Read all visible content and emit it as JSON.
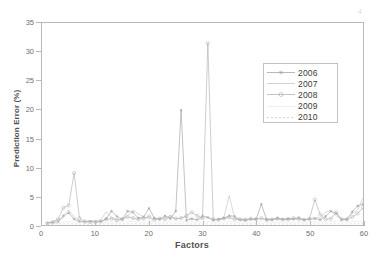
{
  "figure": {
    "background": "#ffffff",
    "frame_color": "#b9b9b9",
    "artifact_mark": "4"
  },
  "axes": {
    "x": {
      "label": "Factors",
      "min": 0,
      "max": 60,
      "ticks": [
        0,
        10,
        20,
        30,
        40,
        50,
        60
      ],
      "tick_labels": [
        "0",
        "10",
        "20",
        "30",
        "40",
        "50",
        "60"
      ]
    },
    "y": {
      "label": "Prediction Error (%)",
      "min": 0,
      "max": 35,
      "ticks": [
        0,
        5,
        10,
        15,
        20,
        25,
        30,
        35
      ],
      "tick_labels": [
        "0",
        "5",
        "10",
        "15",
        "20",
        "25",
        "30",
        "35"
      ]
    }
  },
  "legend": {
    "position": "upper-right-inset",
    "border_color": "#c2c2c2",
    "entries": [
      {
        "label": "2006",
        "style": "line-marker-star",
        "color": "#9a9a9a",
        "marker": "star",
        "dash": "none"
      },
      {
        "label": "2007",
        "style": "line-plain",
        "color": "#bfbfbf",
        "marker": "none",
        "dash": "none"
      },
      {
        "label": "2008",
        "style": "line-marker-circle",
        "color": "#ababab",
        "marker": "circle",
        "dash": "none"
      },
      {
        "label": "2009",
        "style": "line-faint",
        "color": "#e8e8e8",
        "marker": "none",
        "dash": "none"
      },
      {
        "label": "2010",
        "style": "line-dotted",
        "color": "#c9c9c9",
        "marker": "none",
        "dash": "2,2"
      }
    ]
  },
  "chart_data": {
    "type": "line",
    "title": "",
    "xlabel": "Factors",
    "ylabel": "Prediction Error (%)",
    "xlim": [
      0,
      60
    ],
    "ylim": [
      0,
      35
    ],
    "grid": false,
    "legend_position": "upper right (inset)",
    "x": [
      1,
      2,
      3,
      4,
      5,
      6,
      7,
      8,
      9,
      10,
      11,
      12,
      13,
      14,
      15,
      16,
      17,
      18,
      19,
      20,
      21,
      22,
      23,
      24,
      25,
      26,
      27,
      28,
      29,
      30,
      31,
      32,
      33,
      34,
      35,
      36,
      37,
      38,
      39,
      40,
      41,
      42,
      43,
      44,
      45,
      46,
      47,
      48,
      49,
      50,
      51,
      52,
      53,
      54,
      55,
      56,
      57,
      58,
      59,
      60
    ],
    "series": [
      {
        "name": "2006",
        "color": "#9a9a9a",
        "marker": "star",
        "values": [
          0.3,
          0.4,
          0.5,
          1.6,
          2.1,
          1.0,
          0.6,
          0.5,
          0.6,
          0.5,
          0.6,
          1.1,
          2.4,
          1.5,
          1.0,
          2.4,
          2.2,
          1.2,
          1.4,
          2.9,
          1.2,
          1.0,
          1.6,
          1.1,
          2.4,
          19.9,
          0.8,
          1.1,
          0.9,
          1.6,
          1.3,
          0.8,
          1.0,
          1.2,
          1.6,
          1.5,
          0.9,
          0.8,
          1.0,
          1.0,
          3.6,
          0.9,
          0.9,
          1.2,
          1.0,
          1.1,
          1.0,
          1.3,
          0.9,
          1.0,
          1.1,
          0.9,
          1.5,
          2.4,
          2.0,
          0.9,
          1.0,
          2.3,
          3.3,
          3.6
        ]
      },
      {
        "name": "2007",
        "color": "#bfbfbf",
        "marker": "none",
        "values": [
          0.4,
          0.6,
          0.9,
          1.3,
          2.6,
          1.4,
          0.7,
          0.6,
          0.8,
          0.7,
          0.9,
          2.3,
          1.3,
          1.0,
          1.1,
          1.6,
          2.6,
          1.9,
          1.4,
          1.1,
          1.0,
          1.2,
          1.3,
          1.6,
          1.0,
          1.2,
          1.4,
          0.9,
          1.0,
          1.1,
          1.4,
          1.0,
          0.9,
          1.4,
          5.1,
          1.2,
          0.9,
          1.1,
          0.9,
          1.2,
          1.0,
          1.1,
          1.0,
          0.9,
          1.1,
          0.9,
          1.0,
          1.1,
          0.9,
          1.0,
          1.3,
          1.2,
          2.2,
          2.5,
          1.6,
          1.0,
          1.2,
          2.0,
          2.6,
          4.7
        ]
      },
      {
        "name": "2008",
        "color": "#ababab",
        "marker": "circle",
        "values": [
          0.3,
          0.5,
          1.0,
          3.0,
          3.4,
          9.0,
          1.2,
          0.6,
          0.5,
          0.5,
          0.6,
          1.0,
          1.1,
          0.8,
          1.0,
          1.4,
          1.2,
          1.0,
          1.1,
          1.5,
          0.9,
          1.1,
          1.0,
          1.4,
          1.1,
          1.2,
          1.6,
          2.2,
          1.6,
          1.2,
          31.5,
          1.0,
          0.9,
          1.1,
          1.3,
          1.0,
          1.0,
          0.9,
          1.1,
          1.0,
          1.2,
          0.9,
          1.0,
          1.1,
          0.9,
          1.0,
          1.2,
          1.0,
          0.9,
          1.1,
          4.4,
          1.8,
          1.0,
          1.1,
          2.2,
          1.0,
          0.9,
          1.4,
          2.0,
          3.0
        ]
      },
      {
        "name": "2009",
        "color": "#e8e8e8",
        "marker": "none",
        "values": [
          0.2,
          0.3,
          0.4,
          0.5,
          0.6,
          0.5,
          0.4,
          0.4,
          0.4,
          0.4,
          0.4,
          0.5,
          0.6,
          0.5,
          0.5,
          0.6,
          0.6,
          0.5,
          0.5,
          0.6,
          0.5,
          0.5,
          0.5,
          0.6,
          0.5,
          0.6,
          0.5,
          0.5,
          0.5,
          0.5,
          0.6,
          0.5,
          0.5,
          0.5,
          0.6,
          0.5,
          0.5,
          0.5,
          0.5,
          0.5,
          0.6,
          0.5,
          0.5,
          0.5,
          0.5,
          0.5,
          0.5,
          0.5,
          0.5,
          0.5,
          0.6,
          0.5,
          0.5,
          0.6,
          0.6,
          0.5,
          0.5,
          0.6,
          0.6,
          0.7
        ]
      },
      {
        "name": "2010",
        "color": "#c9c9c9",
        "marker": "none",
        "dash": "2,2",
        "values": [
          0.15,
          0.15,
          0.18,
          0.2,
          0.2,
          0.18,
          0.15,
          0.15,
          0.15,
          0.15,
          0.16,
          0.18,
          0.2,
          0.18,
          0.17,
          0.2,
          0.2,
          0.18,
          0.18,
          0.2,
          0.17,
          0.17,
          0.18,
          0.2,
          0.18,
          0.2,
          0.18,
          0.17,
          0.17,
          0.18,
          0.2,
          0.17,
          0.17,
          0.18,
          0.2,
          0.18,
          0.17,
          0.17,
          0.18,
          0.18,
          0.2,
          0.17,
          0.17,
          0.18,
          0.17,
          0.18,
          0.17,
          0.18,
          0.17,
          0.18,
          0.2,
          0.18,
          0.18,
          0.2,
          0.2,
          0.17,
          0.17,
          0.2,
          0.2,
          0.22
        ]
      }
    ],
    "annotations": [
      {
        "text": "peak 2008 at factor 31 = 31.5"
      },
      {
        "text": "peak 2006 at factor 26 = 19.9"
      },
      {
        "text": "peak 2008 at factor 6 = 9.0"
      }
    ]
  }
}
